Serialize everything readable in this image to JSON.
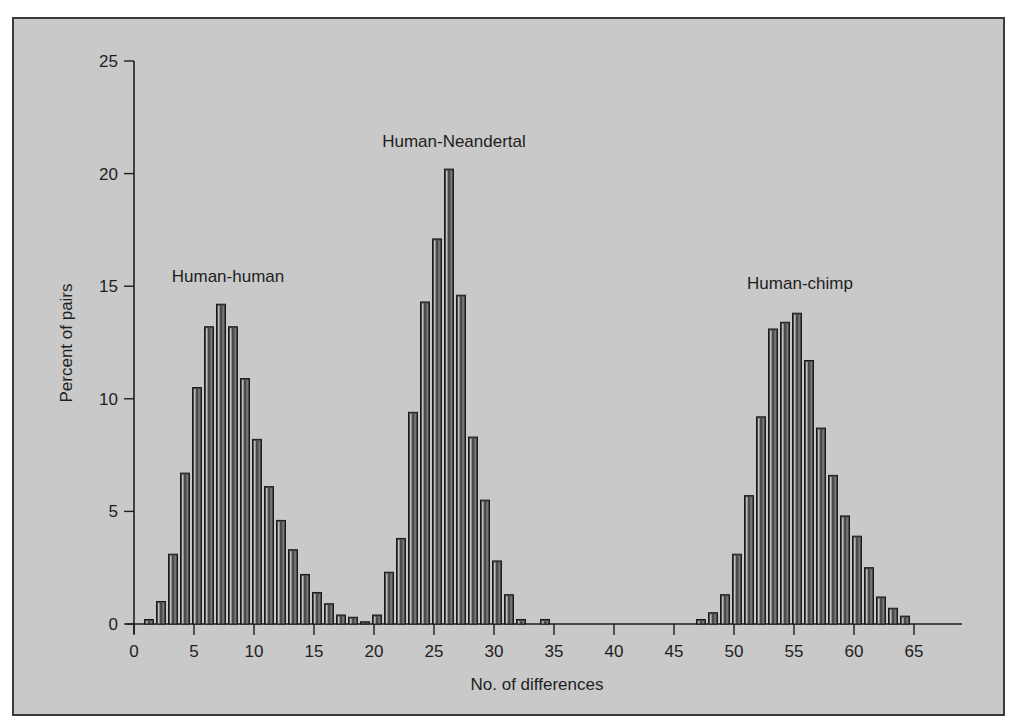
{
  "chart_data": {
    "type": "bar",
    "title": "",
    "xlabel": "No. of differences",
    "ylabel": "Percent of pairs",
    "xlim": [
      0,
      69
    ],
    "ylim": [
      0,
      25
    ],
    "xticks": [
      0,
      5,
      10,
      15,
      20,
      25,
      30,
      35,
      40,
      45,
      50,
      55,
      60,
      65
    ],
    "yticks": [
      0,
      5,
      10,
      15,
      20,
      25
    ],
    "grid": false,
    "legend": "none (inline annotations)",
    "annotations": [
      {
        "text": "Human-human",
        "x": 7.5,
        "y": 15.3
      },
      {
        "text": "Human-Neandertal",
        "x": 27,
        "y": 21.3
      },
      {
        "text": "Human-chimp",
        "x": 56,
        "y": 15.0
      }
    ],
    "series": [
      {
        "name": "Human-human",
        "x": [
          1,
          2,
          3,
          4,
          5,
          6,
          7,
          8,
          9,
          10,
          11,
          12,
          13,
          14,
          15,
          16,
          17,
          18,
          19,
          20
        ],
        "values": [
          0.2,
          1.0,
          3.1,
          6.7,
          10.5,
          13.2,
          14.2,
          13.2,
          10.9,
          8.2,
          6.1,
          4.6,
          3.3,
          2.2,
          1.4,
          0.9,
          0.4,
          0.3,
          0.1,
          0.4
        ]
      },
      {
        "name": "Human-Neandertal",
        "x": [
          21,
          22,
          23,
          24,
          25,
          26,
          27,
          28,
          29,
          30,
          31,
          32,
          34
        ],
        "values": [
          2.3,
          3.8,
          9.4,
          14.3,
          17.1,
          20.2,
          14.6,
          8.3,
          5.5,
          2.8,
          1.3,
          0.2,
          0.2
        ]
      },
      {
        "name": "Human-chimp",
        "x": [
          47,
          48,
          49,
          50,
          51,
          52,
          53,
          54,
          55,
          56,
          57,
          58,
          59,
          60,
          61,
          62,
          63,
          64
        ],
        "values": [
          0.2,
          0.5,
          1.3,
          3.1,
          5.7,
          9.2,
          13.1,
          13.4,
          13.8,
          11.7,
          8.7,
          6.6,
          4.8,
          3.9,
          2.5,
          1.2,
          0.7,
          0.35
        ]
      }
    ]
  },
  "colors": {
    "background": "#c9c9c9",
    "bar_fill": "#4a4a4a",
    "bar_highlight": "#bdbdbd",
    "axis": "#1e1e1e"
  }
}
